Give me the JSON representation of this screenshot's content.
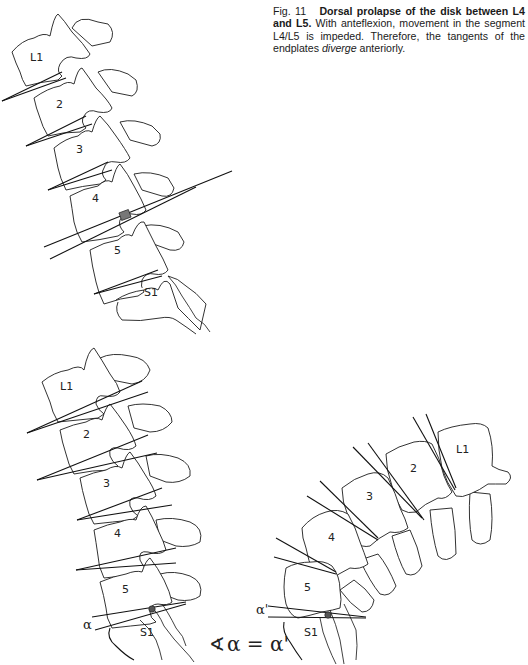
{
  "caption": {
    "fig_number": "Fig. 11",
    "title": "Dorsal prolapse of the disk between L4 and L5.",
    "body_1": " With anteflexion, movement in the segment L4/L5 is impeded. Therefore, the tangents of the endplates ",
    "emphasis": "diverge",
    "body_2": " anteriorly."
  },
  "top_figure": {
    "vertebra_labels": [
      "L1",
      "2",
      "3",
      "4",
      "5",
      "S1"
    ]
  },
  "bottom_left_figure": {
    "vertebra_labels": [
      "L1",
      "2",
      "3",
      "4",
      "5",
      "S1"
    ],
    "angle_label": "α"
  },
  "bottom_right_figure": {
    "vertebra_labels": [
      "L1",
      "2",
      "3",
      "4",
      "5",
      "S1"
    ],
    "angle_label": "α'"
  },
  "equation": {
    "angle_symbol": "∢",
    "text": "α = α'"
  }
}
